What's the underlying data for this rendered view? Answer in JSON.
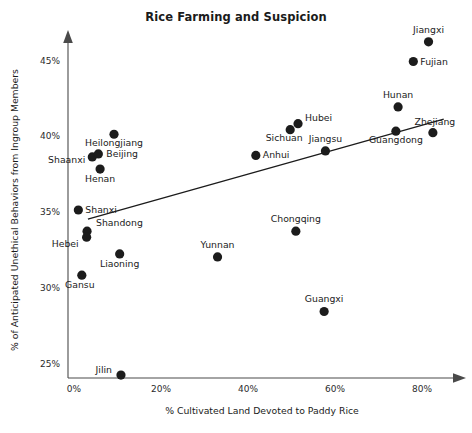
{
  "chart_data": {
    "type": "scatter",
    "title": "Rice Farming and Suspicion",
    "xlabel": "% Cultivated Land Devoted to Paddy Rice",
    "ylabel": "% of Anticipated Unethical Behaviors from Ingroup Members",
    "xlim": [
      -4,
      92
    ],
    "ylim": [
      23.2,
      47.6
    ],
    "xticks": [
      "0%",
      "20%",
      "40%",
      "60%",
      "80%"
    ],
    "xtick_values": [
      0,
      20,
      40,
      60,
      80
    ],
    "yticks": [
      "25%",
      "30%",
      "35%",
      "40%",
      "45%"
    ],
    "ytick_values": [
      25,
      30,
      35,
      40,
      45
    ],
    "grid": false,
    "legend": false,
    "point_color": "#1c1c1c",
    "line_color": "#1b1b1b",
    "axis_color": "#4a4a4a",
    "trendline": {
      "label": "linear fit",
      "x_start": 3.2,
      "y_start": 34.5,
      "x_end": 85.0,
      "y_end": 41.1
    },
    "points": [
      {
        "label": "Jiangxi",
        "x": 81.5,
        "y": 46.2,
        "label_dx": 0,
        "label_dy": -9,
        "label_anchor": "middle"
      },
      {
        "label": "Fujian",
        "x": 78.0,
        "y": 44.9,
        "label_dx": 7,
        "label_dy": 3,
        "label_anchor": "start"
      },
      {
        "label": "Hunan",
        "x": 74.5,
        "y": 41.9,
        "label_dx": 0,
        "label_dy": -9,
        "label_anchor": "middle"
      },
      {
        "label": "Zhejiang",
        "x": 82.5,
        "y": 40.2,
        "label_dx": 2,
        "label_dy": -8,
        "label_anchor": "middle"
      },
      {
        "label": "Guangdong",
        "x": 74.0,
        "y": 40.3,
        "label_dx": 0,
        "label_dy": 12,
        "label_anchor": "middle"
      },
      {
        "label": "Hubei",
        "x": 51.5,
        "y": 40.8,
        "label_dx": 7,
        "label_dy": -3,
        "label_anchor": "start"
      },
      {
        "label": "Sichuan",
        "x": 49.7,
        "y": 40.4,
        "label_dx": -6,
        "label_dy": 11,
        "label_anchor": "middle"
      },
      {
        "label": "Jiangsu",
        "x": 57.8,
        "y": 39.0,
        "label_dx": 0,
        "label_dy": -9,
        "label_anchor": "middle"
      },
      {
        "label": "Anhui",
        "x": 41.8,
        "y": 38.7,
        "label_dx": 7,
        "label_dy": 3,
        "label_anchor": "start"
      },
      {
        "label": "Heilongjiang",
        "x": 9.2,
        "y": 40.1,
        "label_dx": 0,
        "label_dy": 12,
        "label_anchor": "middle"
      },
      {
        "label": "Shaanxi",
        "x": 4.2,
        "y": 38.6,
        "label_dx": -7,
        "label_dy": 6,
        "label_anchor": "end"
      },
      {
        "label": "Beijing",
        "x": 5.6,
        "y": 38.8,
        "label_dx": 8,
        "label_dy": 3,
        "label_anchor": "start"
      },
      {
        "label": "Henan",
        "x": 6.0,
        "y": 37.8,
        "label_dx": 0,
        "label_dy": 13,
        "label_anchor": "middle"
      },
      {
        "label": "Shanxi",
        "x": 1.0,
        "y": 35.1,
        "label_dx": 7,
        "label_dy": 3,
        "label_anchor": "start"
      },
      {
        "label": "Shandong",
        "x": 3.0,
        "y": 33.7,
        "label_dx": 9,
        "label_dy": -5,
        "label_anchor": "start"
      },
      {
        "label": "Hebei",
        "x": 2.9,
        "y": 33.3,
        "label_dx": -8,
        "label_dy": 10,
        "label_anchor": "end"
      },
      {
        "label": "Gansu",
        "x": 1.8,
        "y": 30.8,
        "label_dx": -2,
        "label_dy": 13,
        "label_anchor": "middle"
      },
      {
        "label": "Liaoning",
        "x": 10.5,
        "y": 32.2,
        "label_dx": 0,
        "label_dy": 13,
        "label_anchor": "middle"
      },
      {
        "label": "Yunnan",
        "x": 33.0,
        "y": 32.0,
        "label_dx": 0,
        "label_dy": -9,
        "label_anchor": "middle"
      },
      {
        "label": "Chongqing",
        "x": 51.0,
        "y": 33.7,
        "label_dx": 0,
        "label_dy": -9,
        "label_anchor": "middle"
      },
      {
        "label": "Guangxi",
        "x": 57.5,
        "y": 28.4,
        "label_dx": 0,
        "label_dy": -9,
        "label_anchor": "middle"
      },
      {
        "label": "Jilin",
        "x": 10.8,
        "y": 24.2,
        "label_dx": -9,
        "label_dy": -2,
        "label_anchor": "end"
      }
    ]
  }
}
